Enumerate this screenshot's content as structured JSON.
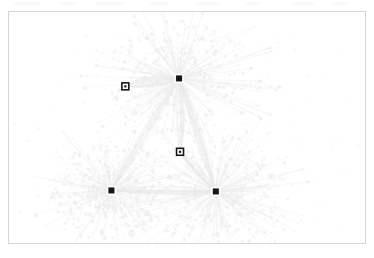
{
  "figure": {
    "kind": "network-graph",
    "background_color": "#ffffff",
    "frame": {
      "x": 8,
      "y": 11,
      "width": 358,
      "height": 233,
      "border_color": "#d6d6d6",
      "border_width": 1
    },
    "scan_artifacts": [
      {
        "x": 14,
        "width": 26
      },
      {
        "x": 58,
        "width": 20
      },
      {
        "x": 96,
        "width": 30
      },
      {
        "x": 150,
        "width": 18
      },
      {
        "x": 196,
        "width": 24
      },
      {
        "x": 246,
        "width": 16
      },
      {
        "x": 292,
        "width": 22
      },
      {
        "x": 332,
        "width": 18
      }
    ]
  },
  "chart_data": {
    "type": "scatter",
    "title": "",
    "subtitle": "",
    "xlabel": "",
    "ylabel": "",
    "grid": false,
    "legend": false,
    "xlim": [
      0,
      358
    ],
    "ylim": [
      0,
      233
    ],
    "edge_color": "#e9e9e9",
    "node_color": "#ededed",
    "marker_color": "#161616",
    "series": [
      {
        "name": "hub-markers",
        "marker": "filled-square",
        "color": "#161616",
        "size": 6,
        "points": [
          {
            "label": "hub-north",
            "x": 171,
            "y": 67
          },
          {
            "label": "hub-southwest",
            "x": 103,
            "y": 180
          },
          {
            "label": "hub-southeast",
            "x": 208,
            "y": 181
          }
        ]
      },
      {
        "name": "site-markers",
        "marker": "hollow-square",
        "color": "#161616",
        "size": 7,
        "points": [
          {
            "label": "site-northwest",
            "x": 117,
            "y": 75
          },
          {
            "label": "site-center",
            "x": 172,
            "y": 141
          }
        ]
      },
      {
        "name": "cluster-cores",
        "marker": "cloud",
        "color": "#ededed",
        "points": [
          {
            "label": "core-north",
            "x": 171,
            "y": 67,
            "radius": 86
          },
          {
            "label": "core-southwest",
            "x": 103,
            "y": 180,
            "radius": 74
          },
          {
            "label": "core-southeast",
            "x": 208,
            "y": 181,
            "radius": 86
          }
        ]
      }
    ],
    "trunks": [
      {
        "from": "hub-north",
        "to": "hub-southwest"
      },
      {
        "from": "hub-north",
        "to": "hub-southeast"
      },
      {
        "from": "hub-southwest",
        "to": "hub-southeast"
      },
      {
        "from": "hub-north",
        "to": "site-center"
      },
      {
        "from": "hub-southeast",
        "to": "site-center"
      },
      {
        "from": "hub-north",
        "to": "site-northwest"
      }
    ]
  }
}
